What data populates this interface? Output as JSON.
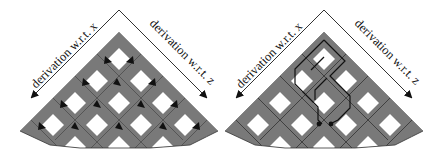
{
  "figure": {
    "panels": [
      {
        "id": "left",
        "variant": "arrows",
        "label_x": "derivation w.r.t. x",
        "label_z": "derivation w.r.t. z"
      },
      {
        "id": "right",
        "variant": "path",
        "label_x": "derivation w.r.t. x",
        "label_z": "derivation w.r.t. z"
      }
    ],
    "colors": {
      "cell_gray": "#7a7a7a",
      "hole_white": "#ffffff",
      "line": "#222222",
      "arrow": "#111111"
    }
  }
}
